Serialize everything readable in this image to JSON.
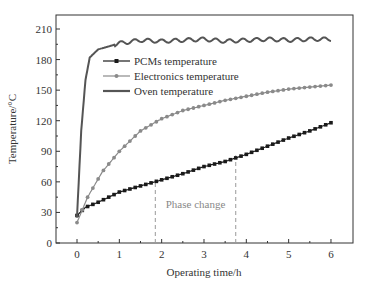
{
  "chart_data": {
    "type": "line",
    "title": "",
    "xlabel": "Operating time/h",
    "ylabel": "Temperature/°C",
    "xlim": [
      -0.5,
      6.5
    ],
    "ylim": [
      0,
      220
    ],
    "xticks": [
      0,
      1,
      2,
      3,
      4,
      5,
      6
    ],
    "yticks": [
      0,
      30,
      60,
      90,
      120,
      150,
      180,
      210
    ],
    "grid": false,
    "legend_position": "upper-left-inside",
    "series": [
      {
        "name": "PCMs temperature",
        "marker": "square",
        "color": "#1a1a1a",
        "x": [
          0,
          0.2,
          0.5,
          1,
          1.5,
          2,
          2.5,
          3,
          3.5,
          4,
          4.5,
          5,
          5.5,
          6
        ],
        "values": [
          27,
          35,
          40,
          50,
          56,
          62,
          68,
          75,
          80,
          87,
          95,
          103,
          110,
          118
        ]
      },
      {
        "name": "Electronics temperature",
        "marker": "circle",
        "color": "#8a8a8a",
        "x": [
          0,
          0.25,
          0.6,
          1,
          1.5,
          2,
          2.5,
          3,
          3.5,
          4,
          4.5,
          5,
          5.5,
          6
        ],
        "values": [
          20,
          45,
          70,
          90,
          110,
          122,
          130,
          135,
          140,
          144,
          148,
          151,
          153,
          155
        ]
      },
      {
        "name": "Oven temperature",
        "marker": "none",
        "color": "#555555",
        "x": [
          0,
          0.1,
          0.2,
          0.3,
          0.5,
          0.75,
          1,
          1.5,
          2,
          2.5,
          3,
          3.5,
          4,
          4.5,
          5,
          5.5,
          6
        ],
        "values": [
          25,
          110,
          160,
          182,
          190,
          193,
          196,
          199,
          198,
          199,
          200,
          198,
          199,
          200,
          199,
          200,
          200
        ]
      }
    ],
    "annotations": [
      {
        "text": "Phase change",
        "x": 2.8,
        "y": 38
      },
      {
        "type": "vline-dashed",
        "x": 1.85,
        "y_from": 0,
        "y_to": 62
      },
      {
        "type": "vline-dashed",
        "x": 3.75,
        "y_from": 0,
        "y_to": 86
      }
    ]
  }
}
